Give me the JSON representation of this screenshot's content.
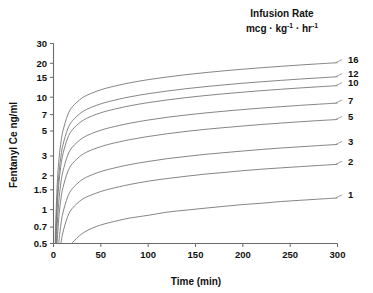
{
  "chart_data": {
    "type": "line",
    "title": "",
    "legend_title_line1": "Infusion Rate",
    "legend_title_line2_prefix": "mcg · kg",
    "legend_title_line2_sup1": "-1",
    "legend_title_line2_mid": " · hr",
    "legend_title_line2_sup2": "-1",
    "legend_position": "right-outside",
    "xlabel": "Time (min)",
    "ylabel": "Fentanyl Ce ng/ml",
    "xlim": [
      0,
      300
    ],
    "ylim": [
      0.5,
      30
    ],
    "yscale": "log",
    "xscale": "linear",
    "grid": false,
    "xticks": [
      0,
      50,
      100,
      150,
      200,
      250,
      300
    ],
    "xticklabels": [
      "0",
      "50",
      "100",
      "150",
      "200",
      "250",
      "300"
    ],
    "yticks": [
      0.5,
      0.7,
      1,
      1.5,
      2,
      3,
      5,
      7,
      10,
      15,
      20,
      30
    ],
    "yticklabels": [
      "0.5",
      "0.7",
      "1",
      "1.5",
      "2",
      "3",
      "5",
      "7",
      "10",
      "15",
      "20",
      "30"
    ],
    "x": [
      0,
      2,
      4,
      6,
      8,
      10,
      15,
      20,
      30,
      40,
      50,
      60,
      80,
      100,
      120,
      140,
      160,
      180,
      200,
      220,
      240,
      260,
      280,
      300
    ],
    "series": [
      {
        "name": "16",
        "label": "16",
        "infusion_rate": 16,
        "values": [
          0.0,
          0.62,
          1.73,
          2.93,
          4.05,
          5.03,
          6.94,
          8.22,
          9.81,
          10.83,
          11.62,
          12.28,
          13.38,
          14.31,
          15.12,
          15.85,
          16.52,
          17.14,
          17.73,
          18.28,
          18.8,
          19.31,
          19.79,
          20.25
        ],
        "end_value": 20.25
      },
      {
        "name": "12",
        "label": "12",
        "infusion_rate": 12,
        "values": [
          0.0,
          0.47,
          1.3,
          2.2,
          3.04,
          3.77,
          5.21,
          6.17,
          7.36,
          8.12,
          8.72,
          9.21,
          10.04,
          10.73,
          11.34,
          11.89,
          12.39,
          12.86,
          13.3,
          13.71,
          14.1,
          14.48,
          14.84,
          15.19
        ],
        "end_value": 15.19
      },
      {
        "name": "10",
        "label": "10",
        "infusion_rate": 10,
        "values": [
          0.0,
          0.39,
          1.08,
          1.83,
          2.53,
          3.14,
          4.34,
          5.14,
          6.13,
          6.77,
          7.26,
          7.67,
          8.36,
          8.94,
          9.45,
          9.91,
          10.33,
          10.71,
          11.08,
          11.43,
          11.75,
          12.07,
          12.37,
          12.66
        ],
        "end_value": 12.66
      },
      {
        "name": "7",
        "label": "7",
        "infusion_rate": 7,
        "values": [
          0.0,
          0.27,
          0.76,
          1.28,
          1.77,
          2.2,
          3.04,
          3.6,
          4.29,
          4.74,
          5.08,
          5.37,
          5.85,
          6.26,
          6.62,
          6.94,
          7.23,
          7.5,
          7.76,
          8.0,
          8.23,
          8.45,
          8.66,
          8.86
        ],
        "end_value": 8.86
      },
      {
        "name": "5",
        "label": "5",
        "infusion_rate": 5,
        "values": [
          0.0,
          0.19,
          0.54,
          0.92,
          1.27,
          1.57,
          2.17,
          2.57,
          3.07,
          3.39,
          3.63,
          3.84,
          4.18,
          4.47,
          4.73,
          4.96,
          5.17,
          5.36,
          5.54,
          5.72,
          5.88,
          6.04,
          6.19,
          6.33
        ],
        "end_value": 6.33
      },
      {
        "name": "3",
        "label": "3",
        "infusion_rate": 3,
        "values": [
          0.0,
          0.12,
          0.32,
          0.55,
          0.76,
          0.94,
          1.3,
          1.54,
          1.84,
          2.03,
          2.18,
          2.3,
          2.51,
          2.68,
          2.84,
          2.97,
          3.1,
          3.21,
          3.32,
          3.43,
          3.53,
          3.62,
          3.71,
          3.8
        ],
        "end_value": 3.8
      },
      {
        "name": "2",
        "label": "2",
        "infusion_rate": 2,
        "values": [
          0.0,
          0.08,
          0.22,
          0.37,
          0.51,
          0.63,
          0.87,
          1.03,
          1.23,
          1.35,
          1.45,
          1.53,
          1.67,
          1.79,
          1.89,
          1.98,
          2.07,
          2.14,
          2.22,
          2.29,
          2.35,
          2.41,
          2.47,
          2.53
        ],
        "end_value": 2.53
      },
      {
        "name": "1",
        "label": "1",
        "infusion_rate": 1,
        "values": [
          0.0,
          0.04,
          0.11,
          0.18,
          0.25,
          0.31,
          0.43,
          0.51,
          0.61,
          0.68,
          0.73,
          0.77,
          0.84,
          0.89,
          0.95,
          0.99,
          1.03,
          1.07,
          1.11,
          1.14,
          1.18,
          1.21,
          1.24,
          1.27
        ],
        "end_value": 1.27
      }
    ]
  },
  "colors": {
    "curve": "#777777",
    "axis": "#6a6a6a",
    "text": "#111111",
    "background": "#ffffff"
  }
}
